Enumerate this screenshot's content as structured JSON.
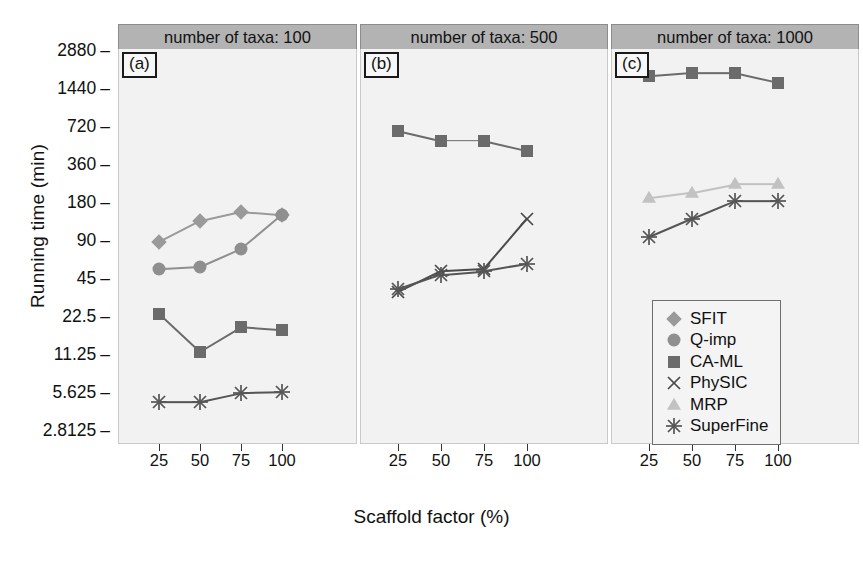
{
  "figure": {
    "ylabel": "Running time (min)",
    "xlabel": "Scaffold factor (%)",
    "y_ticks": [
      "2880",
      "1440",
      "720",
      "360",
      "180",
      "90",
      "45",
      "22.5",
      "11.25",
      "5.625",
      "2.8125"
    ],
    "x_ticks": [
      "25",
      "50",
      "75",
      "100"
    ]
  },
  "panels": [
    {
      "header": "number of taxa: 100",
      "tag": "(a)"
    },
    {
      "header": "number of taxa: 500",
      "tag": "(b)"
    },
    {
      "header": "number of taxa: 1000",
      "tag": "(c)"
    }
  ],
  "legend": {
    "items": [
      {
        "label": "SFIT",
        "marker": "diamond",
        "color": "#9a9a9a"
      },
      {
        "label": "Q-imp",
        "marker": "circle",
        "color": "#8f8f8f"
      },
      {
        "label": "CA-ML",
        "marker": "square",
        "color": "#6b6b6b"
      },
      {
        "label": "PhySIC",
        "marker": "cross",
        "color": "#4a4a4a"
      },
      {
        "label": "MRP",
        "marker": "triangle",
        "color": "#c2c2c2"
      },
      {
        "label": "SuperFine",
        "marker": "asterisk",
        "color": "#555555"
      }
    ]
  },
  "chart_data": {
    "type": "line",
    "title": "",
    "xlabel": "Scaffold factor (%)",
    "ylabel": "Running time (min)",
    "yscale": "log2",
    "ylim": [
      2.8125,
      2880
    ],
    "ytick_values": [
      2880,
      1440,
      720,
      360,
      180,
      90,
      45,
      22.5,
      11.25,
      5.625,
      2.8125
    ],
    "x": [
      25,
      50,
      75,
      100
    ],
    "grid": false,
    "legend_position": "bottom-right",
    "facets": [
      {
        "facet_label": "number of taxa: 100",
        "panel_tag": "(a)",
        "series": [
          {
            "name": "SFIT",
            "values": [
              85,
              125,
              148,
              140
            ]
          },
          {
            "name": "Q-imp",
            "values": [
              52,
              54,
              75,
              140
            ]
          },
          {
            "name": "CA-ML",
            "values": [
              23,
              11.5,
              18,
              17
            ]
          },
          {
            "name": "SuperFine",
            "values": [
              4.6,
              4.6,
              5.4,
              5.5
            ]
          }
        ]
      },
      {
        "facet_label": "number of taxa: 500",
        "panel_tag": "(b)",
        "series": [
          {
            "name": "CA-ML",
            "values": [
              650,
              540,
              540,
              450
            ]
          },
          {
            "name": "PhySIC",
            "values": [
              34,
              50,
              52,
              130
            ]
          },
          {
            "name": "SuperFine",
            "values": [
              36,
              47,
              50,
              57
            ]
          }
        ]
      },
      {
        "facet_label": "number of taxa: 1000",
        "panel_tag": "(c)",
        "series": [
          {
            "name": "CA-ML",
            "values": [
              1750,
              1850,
              1850,
              1550
            ]
          },
          {
            "name": "MRP",
            "values": [
              190,
              210,
              245,
              245
            ]
          },
          {
            "name": "SuperFine",
            "values": [
              93,
              130,
              180,
              180
            ]
          }
        ]
      }
    ]
  }
}
